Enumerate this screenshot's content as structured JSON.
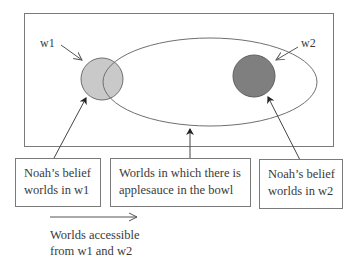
{
  "diagram": {
    "world_labels": {
      "w1": "w1",
      "w2": "w2"
    },
    "boxes": [
      {
        "id": "belief-w1",
        "lines": [
          "Noah’s belief",
          "worlds in w1"
        ]
      },
      {
        "id": "applesauce",
        "lines": [
          "Worlds in which there is",
          "applesauce in the bowl"
        ]
      },
      {
        "id": "belief-w2",
        "lines": [
          "Noah’s belief",
          "worlds in w2"
        ]
      }
    ],
    "legend": {
      "lines": [
        "Worlds accessible",
        "from w1 and w2"
      ]
    },
    "colors": {
      "w1_fill": "#c9c9c9",
      "w2_fill": "#7f7f7f",
      "stroke": "#6f6f6f",
      "background": "#ffffff"
    }
  }
}
